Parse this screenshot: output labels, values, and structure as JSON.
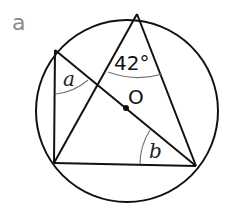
{
  "part_label": "a",
  "diagram": {
    "circle": {
      "cx": 127,
      "cy": 111,
      "r": 91
    },
    "center_label": "O",
    "points": {
      "top": [
        137,
        14
      ],
      "left_upper": [
        55,
        50
      ],
      "left_lower": [
        54,
        163
      ],
      "right_lower": [
        196,
        166
      ]
    },
    "angles": {
      "top_angle": "42°",
      "a_label": "a",
      "b_label": "b"
    },
    "colors": {
      "stroke": "#111111",
      "arc": "#777777",
      "part_label": "#8a8a8a"
    }
  }
}
